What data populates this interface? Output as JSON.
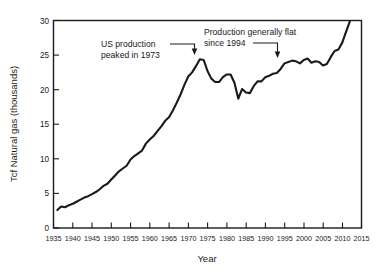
{
  "chart_data": {
    "type": "line",
    "title": "",
    "xlabel": "Year",
    "ylabel": "Tcf Natural gas (thousands)",
    "xlim": [
      1935,
      2015
    ],
    "ylim": [
      0,
      30
    ],
    "grid": false,
    "legend": "none",
    "xticks": [
      1935,
      1940,
      1945,
      1950,
      1955,
      1960,
      1965,
      1970,
      1975,
      1980,
      1985,
      1990,
      1995,
      2000,
      2005,
      2010,
      2015
    ],
    "yticks": [
      0,
      5,
      10,
      15,
      20,
      25,
      30
    ],
    "line_color": "#1a1a1a",
    "series": [
      {
        "name": "US natural gas production",
        "x": [
          1936,
          1937,
          1938,
          1939,
          1940,
          1941,
          1942,
          1943,
          1944,
          1945,
          1946,
          1947,
          1948,
          1949,
          1950,
          1951,
          1952,
          1953,
          1954,
          1955,
          1956,
          1957,
          1958,
          1959,
          1960,
          1961,
          1962,
          1963,
          1964,
          1965,
          1966,
          1967,
          1968,
          1969,
          1970,
          1971,
          1972,
          1973,
          1974,
          1975,
          1976,
          1977,
          1978,
          1979,
          1980,
          1981,
          1982,
          1983,
          1984,
          1985,
          1986,
          1987,
          1988,
          1989,
          1990,
          1991,
          1992,
          1993,
          1994,
          1995,
          1996,
          1997,
          1998,
          1999,
          2000,
          2001,
          2002,
          2003,
          2004,
          2005,
          2006,
          2007,
          2008,
          2009,
          2010,
          2011,
          2012
        ],
        "y": [
          2.6,
          3.1,
          3.0,
          3.3,
          3.5,
          3.8,
          4.1,
          4.4,
          4.6,
          4.9,
          5.2,
          5.6,
          6.1,
          6.4,
          7.0,
          7.6,
          8.2,
          8.6,
          9.0,
          9.9,
          10.4,
          10.8,
          11.2,
          12.2,
          12.8,
          13.3,
          14.0,
          14.7,
          15.5,
          16.0,
          17.0,
          18.1,
          19.3,
          20.7,
          21.9,
          22.5,
          23.4,
          24.4,
          24.3,
          22.7,
          21.6,
          21.1,
          21.1,
          21.8,
          22.2,
          22.2,
          21.0,
          18.7,
          20.1,
          19.6,
          19.5,
          20.5,
          21.2,
          21.2,
          21.8,
          22.0,
          22.3,
          22.4,
          23.0,
          23.8,
          24.0,
          24.2,
          24.1,
          23.8,
          24.3,
          24.5,
          23.9,
          24.1,
          24.0,
          23.5,
          23.7,
          24.7,
          25.6,
          25.8,
          26.8,
          28.4,
          29.9
        ]
      }
    ],
    "annotations": [
      {
        "id": "peak-1973",
        "text_line_1": "US production",
        "text_line_2": "peaked in 1973",
        "points_to_year": 1973,
        "points_to_value": 24.4
      },
      {
        "id": "flat-since-1994",
        "text_line_1": "Production generally flat",
        "text_line_2": "since 1994",
        "points_to_year": 1994,
        "points_to_value": 23.0
      }
    ]
  }
}
